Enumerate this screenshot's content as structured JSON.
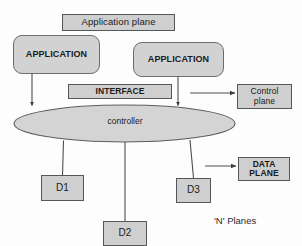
{
  "diagram": {
    "colors": {
      "node_fill": "#cfcfcf",
      "node_stroke": "#55585a",
      "ellipse_fill": "#d4d4d4",
      "connector": "#4b4e50",
      "background": "#fdfdfd"
    },
    "nodes": {
      "application_plane": {
        "label": "Application plane",
        "shape": "rectangle"
      },
      "application_left": {
        "label": "APPLICATION",
        "shape": "rounded-rectangle"
      },
      "application_right": {
        "label": "APPLICATION",
        "shape": "rounded-rectangle"
      },
      "interface": {
        "label": "INTERFACE",
        "shape": "rectangle"
      },
      "control_plane": {
        "label_line1": "Control",
        "label_line2": "plane",
        "shape": "rectangle"
      },
      "controller": {
        "label": "controller",
        "shape": "ellipse"
      },
      "data_plane": {
        "label_line1": "DATA",
        "label_line2": "PLANE",
        "shape": "rectangle"
      },
      "device_1": {
        "label": "D1",
        "shape": "rectangle"
      },
      "device_2": {
        "label": "D2",
        "shape": "rectangle"
      },
      "device_3": {
        "label": "D3",
        "shape": "rectangle"
      }
    },
    "annotations": {
      "n_planes": "'N' Planes"
    },
    "connectors": [
      {
        "name": "app-left-to-controller",
        "from": "application_left",
        "to": "controller",
        "arrow": true
      },
      {
        "name": "app-right-to-controller",
        "from": "application_right",
        "to": "controller",
        "arrow": true
      },
      {
        "name": "pointer-to-control-plane",
        "from": "interface-area",
        "to": "control_plane",
        "arrow": true
      },
      {
        "name": "pointer-to-data-plane",
        "from": "device-area",
        "to": "data_plane",
        "arrow": true
      },
      {
        "name": "controller-to-d1",
        "from": "controller",
        "to": "device_1",
        "arrow": false
      },
      {
        "name": "controller-to-d2",
        "from": "controller",
        "to": "device_2",
        "arrow": false
      },
      {
        "name": "controller-to-d3",
        "from": "controller",
        "to": "device_3",
        "arrow": false
      }
    ]
  }
}
